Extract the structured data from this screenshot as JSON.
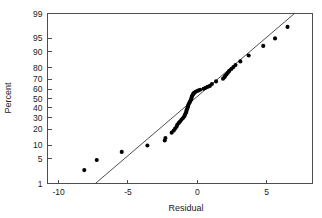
{
  "chart_data": {
    "type": "scatter",
    "title": "",
    "subtitle": "",
    "xlabel": "Residual",
    "ylabel": "Percent",
    "grid": false,
    "legend": null,
    "xlim": [
      -10.8,
      8.3
    ],
    "ylim_percent": [
      1,
      99
    ],
    "yscale": "normal-probability",
    "xticks": [
      -10,
      -5,
      0,
      5
    ],
    "xticklabels": [
      "-10",
      "-5",
      "0",
      "5"
    ],
    "yticks": [
      1,
      5,
      10,
      20,
      30,
      40,
      50,
      60,
      70,
      80,
      90,
      95,
      99
    ],
    "yticklabels": [
      "1",
      "5",
      "10",
      "20",
      "30",
      "40",
      "50",
      "60",
      "70",
      "80",
      "90",
      "95",
      "99"
    ],
    "series": [
      {
        "name": "Residuals",
        "marker": "filled-circle",
        "color": "#000000",
        "x": [
          -8.15,
          -7.25,
          -5.45,
          -3.6,
          -2.35,
          -2.3,
          -1.85,
          -1.7,
          -1.6,
          -1.5,
          -1.45,
          -1.35,
          -1.25,
          -1.15,
          -1.05,
          -0.95,
          -0.9,
          -0.85,
          -0.8,
          -0.78,
          -0.75,
          -0.7,
          -0.68,
          -0.65,
          -0.6,
          -0.55,
          -0.5,
          -0.45,
          -0.42,
          -0.4,
          -0.35,
          -0.3,
          -0.25,
          -0.2,
          -0.1,
          0.05,
          0.2,
          0.45,
          0.6,
          0.75,
          0.9,
          1.05,
          1.35,
          1.85,
          1.95,
          2.0,
          2.1,
          2.2,
          2.3,
          2.45,
          2.6,
          2.75,
          3.1,
          3.7,
          4.75,
          5.6,
          6.5
        ],
        "percent": [
          2.5,
          4.6,
          7.2,
          9.9,
          12.5,
          14.0,
          17.5,
          19.0,
          20.5,
          22.0,
          23.5,
          25.0,
          26.5,
          28.0,
          29.5,
          31.0,
          32.5,
          34.0,
          35.5,
          37.0,
          38.5,
          40.0,
          41.5,
          43.0,
          44.5,
          46.0,
          47.5,
          49.0,
          50.5,
          52.0,
          53.5,
          55.0,
          55.8,
          56.5,
          57.5,
          58.5,
          59.5,
          60.5,
          61.5,
          62.5,
          63.5,
          65.5,
          68.0,
          70.5,
          72.0,
          73.0,
          74.5,
          76.0,
          77.5,
          79.0,
          80.5,
          82.0,
          84.5,
          88.0,
          92.5,
          95.0,
          97.5
        ]
      }
    ],
    "reference_line": {
      "name": "normal fit line",
      "x_start": -7.35,
      "percent_start": 1.0,
      "x_end": 7.0,
      "percent_end": 99.0,
      "color": "#3a3a3a"
    }
  },
  "axes": {
    "x_title": "Residual",
    "y_title": "Percent"
  }
}
